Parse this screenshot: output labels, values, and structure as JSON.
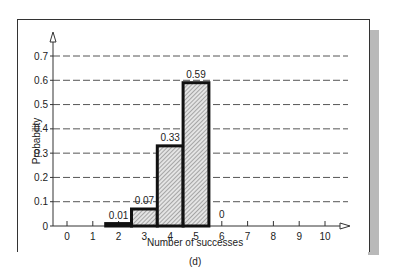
{
  "chart_data": {
    "type": "bar",
    "title": "",
    "subtitle": "(d)",
    "xlabel": "Number of successes",
    "ylabel": "Probability",
    "categories": [
      "0",
      "1",
      "2",
      "3",
      "4",
      "5",
      "6",
      "7",
      "8",
      "9",
      "10"
    ],
    "values": [
      0,
      0,
      0.01,
      0.07,
      0.33,
      0.59,
      0,
      0,
      0,
      0,
      0
    ],
    "data_labels": [
      {
        "x": "2",
        "label": "0.01"
      },
      {
        "x": "3",
        "label": "0.07"
      },
      {
        "x": "4",
        "label": "0.33"
      },
      {
        "x": "5",
        "label": "0.59"
      },
      {
        "x": "6",
        "label": "0"
      }
    ],
    "yticks": [
      "0",
      "0.1",
      "0.2",
      "0.3",
      "0.4",
      "0.5",
      "0.6",
      "0.7"
    ],
    "ylim": [
      0,
      0.7
    ],
    "grid": "horizontal dashed",
    "legend": null,
    "bar_style": "hatched with thick black outline"
  },
  "labels": {
    "xlabel": "Number of successes",
    "ylabel": "Probability",
    "caption": "(d)"
  },
  "colors": {
    "bar_fill": "#d9d9d9",
    "bar_outline": "#111111",
    "grid": "#555555",
    "shadow": "#b9b9b9"
  }
}
